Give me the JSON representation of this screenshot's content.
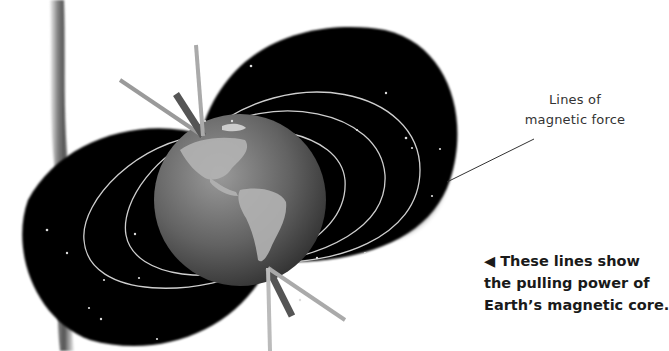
{
  "diagram": {
    "labels": {
      "lines_of_force": [
        "Lines of",
        "magnetic force"
      ]
    },
    "caption": {
      "arrow": "◀",
      "lines": [
        "These lines show",
        "the pulling power of",
        "Earth’s magnetic core."
      ]
    },
    "colors": {
      "background": "#ffffff",
      "field_lobes": "#050505",
      "field_lines": "#d8d8d8",
      "globe": "#6a6a6a",
      "continents": "#b8b8b8",
      "left_bar": "#7a7a7a"
    }
  }
}
